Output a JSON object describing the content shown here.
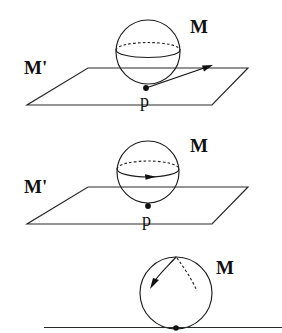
{
  "figure": {
    "background_color": "#ffffff",
    "ink_color": "#1d1d1d",
    "panels": [
      {
        "id": "panel-1",
        "description": "sphere tangent to plane with tangent vector at point p",
        "labels": {
          "manifold": "M",
          "plane": "M'",
          "point": "p"
        },
        "sphere": {
          "cx": 148,
          "cy": 52,
          "r": 32
        },
        "equator": {
          "cx": 148,
          "cy": 50,
          "rx": 32,
          "ry": 7.5
        },
        "plane": {
          "top_left": {
            "x": 88,
            "y": 68
          },
          "top_right": {
            "x": 248,
            "y": 68
          },
          "bottom_right": {
            "x": 212,
            "y": 105
          },
          "bottom_left": {
            "x": 27,
            "y": 105
          }
        },
        "tangent_point": {
          "x": 146,
          "y": 88
        },
        "tangent_arrow": {
          "x1": 146,
          "y1": 88,
          "x2": 211,
          "y2": 66
        }
      },
      {
        "id": "panel-2",
        "description": "sphere tangent to plane with arrow along the equator",
        "labels": {
          "manifold": "M",
          "plane": "M'",
          "point": "p"
        },
        "sphere": {
          "cx": 148,
          "cy": 172,
          "r": 31
        },
        "equator": {
          "cx": 148,
          "cy": 169,
          "rx": 31,
          "ry": 8
        },
        "plane": {
          "top_left": {
            "x": 88,
            "y": 187
          },
          "top_right": {
            "x": 248,
            "y": 187
          },
          "bottom_right": {
            "x": 212,
            "y": 224
          },
          "bottom_left": {
            "x": 27,
            "y": 224
          }
        },
        "tangent_point": {
          "x": 148,
          "y": 206
        },
        "equator_arrow_at": {
          "x": 150,
          "y": 177
        }
      },
      {
        "id": "panel-3",
        "description": "sphere resting on a straight line with meridian arc and arrow",
        "labels": {
          "manifold": "M"
        },
        "sphere": {
          "cx": 176,
          "cy": 293,
          "r": 36
        },
        "baseline": {
          "x1": 44,
          "y1": 327,
          "x2": 282,
          "y2": 327
        },
        "contact_point": {
          "x": 176,
          "y": 328
        },
        "meridian_solid": {
          "from": {
            "x": 176,
            "y": 257
          },
          "to": {
            "x": 152,
            "y": 283
          }
        },
        "meridian_dashed": {
          "from": {
            "x": 176,
            "y": 257
          },
          "to": {
            "x": 197,
            "y": 290
          }
        }
      }
    ],
    "label_positions": {
      "M1": {
        "x": 190,
        "y": 33
      },
      "Mp1": {
        "x": 24,
        "y": 74
      },
      "p1": {
        "x": 140,
        "y": 107
      },
      "M2": {
        "x": 190,
        "y": 152
      },
      "Mp2": {
        "x": 24,
        "y": 193
      },
      "p2": {
        "x": 142,
        "y": 226
      },
      "M3": {
        "x": 216,
        "y": 274
      }
    }
  }
}
